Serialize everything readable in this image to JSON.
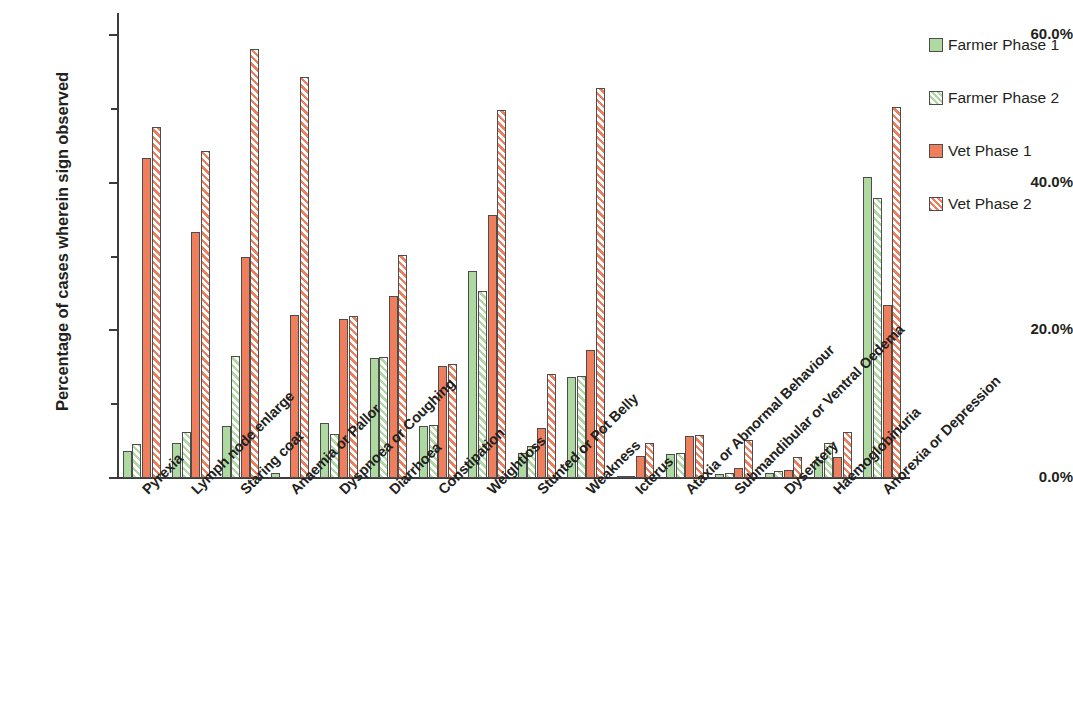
{
  "chart_data": {
    "type": "bar",
    "title": "",
    "xlabel": "",
    "ylabel": "Percentage of cases wherein sign observed",
    "ylim": [
      0,
      63
    ],
    "grid": false,
    "legend_position": "right",
    "y_ticks": [
      {
        "value": 0,
        "label": "0.0%",
        "major": true
      },
      {
        "value": 10,
        "label": "",
        "major": false
      },
      {
        "value": 20,
        "label": "20.0%",
        "major": true
      },
      {
        "value": 30,
        "label": "",
        "major": false
      },
      {
        "value": 40,
        "label": "40.0%",
        "major": true
      },
      {
        "value": 50,
        "label": "",
        "major": false
      },
      {
        "value": 60,
        "label": "60.0%",
        "major": true
      }
    ],
    "categories": [
      "Pyrexia",
      "Lymph node enlarge",
      "Staring coat",
      "Anaemia or Pallor",
      "Dyspnoea or Coughing",
      "Diarrhoea",
      "Constipation",
      "Weightloss",
      "Stunted or Pot Belly",
      "Weakness",
      "Icterus",
      "Ataxia or Abnormal Behaviour",
      "Submandibular or Ventral Oedema",
      "Dysentery",
      "Haemoglobinuria",
      "Anorexia or Depression"
    ],
    "series": [
      {
        "name": "Farmer Phase 1",
        "key": "f1",
        "color": "#aed9a0",
        "pattern": "solid",
        "values": [
          3.7,
          4.7,
          7.1,
          0.7,
          7.4,
          16.3,
          7.1,
          28.0,
          3.4,
          13.7,
          0.2,
          3.2,
          0.6,
          0.7,
          2.5,
          40.8
        ]
      },
      {
        "name": "Farmer Phase 2",
        "key": "f2",
        "color": "#aed9a0",
        "pattern": "hatched",
        "values": [
          4.6,
          6.2,
          16.5,
          0.0,
          6.0,
          16.4,
          7.2,
          25.3,
          4.4,
          13.8,
          0.2,
          3.4,
          0.7,
          0.9,
          4.7,
          38.0
        ]
      },
      {
        "name": "Vet Phase 1",
        "key": "v1",
        "color": "#ef7e5c",
        "pattern": "solid",
        "values": [
          43.4,
          33.3,
          30.0,
          22.1,
          21.6,
          24.6,
          15.2,
          35.7,
          6.8,
          17.4,
          3.0,
          5.7,
          1.4,
          1.1,
          2.9,
          23.4
        ]
      },
      {
        "name": "Vet Phase 2",
        "key": "v2",
        "color": "#ef7e5c",
        "pattern": "hatched",
        "values": [
          47.6,
          44.3,
          58.1,
          54.3,
          21.9,
          30.2,
          15.4,
          49.8,
          14.1,
          52.8,
          4.7,
          5.8,
          5.2,
          2.9,
          6.2,
          50.3
        ]
      }
    ]
  },
  "legend": {
    "items": [
      {
        "label": "Farmer Phase 1",
        "key": "f1"
      },
      {
        "label": "Farmer Phase 2",
        "key": "f2"
      },
      {
        "label": "Vet Phase 1",
        "key": "v1"
      },
      {
        "label": "Vet Phase 2",
        "key": "v2"
      }
    ]
  }
}
